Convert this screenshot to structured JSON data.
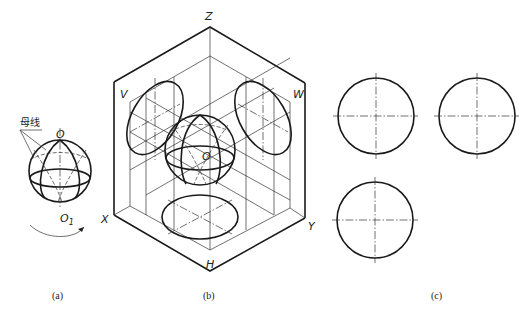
{
  "figure_a": {
    "caption": "(a)",
    "label_generatrix": "母线",
    "label_top": "O",
    "label_bottom": "O",
    "label_bottom_sub": "1"
  },
  "figure_b": {
    "caption": "(b)",
    "axis_labels": {
      "z": "Z",
      "x": "X",
      "y": "Y"
    },
    "plane_labels": {
      "v": "V",
      "w": "W",
      "h": "H"
    },
    "center_label": "O"
  },
  "figure_c": {
    "caption": "(c)",
    "views": [
      "front-view-circle",
      "side-view-circle",
      "top-view-circle"
    ]
  }
}
